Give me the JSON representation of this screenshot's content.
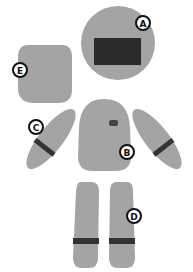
{
  "colors": {
    "part_fill": "#a4a4a4",
    "dark_fill": "#2b2b2b",
    "label_stroke": "#111111",
    "label_fill": "#ffffff",
    "background": "#ffffff"
  },
  "labels": {
    "A": "A",
    "B": "B",
    "C": "C",
    "D": "D",
    "E": "E"
  },
  "parts": [
    {
      "id": "head",
      "label": "A",
      "shape": "circle with dark rectangle"
    },
    {
      "id": "torso",
      "label": "B",
      "shape": "rounded body with small dark mark"
    },
    {
      "id": "arms",
      "label": "C",
      "shape": "two elongated ovals with dark bands"
    },
    {
      "id": "legs",
      "label": "D",
      "shape": "two long rounded bars with dark bands"
    },
    {
      "id": "square-piece",
      "label": "E",
      "shape": "rounded square"
    }
  ]
}
